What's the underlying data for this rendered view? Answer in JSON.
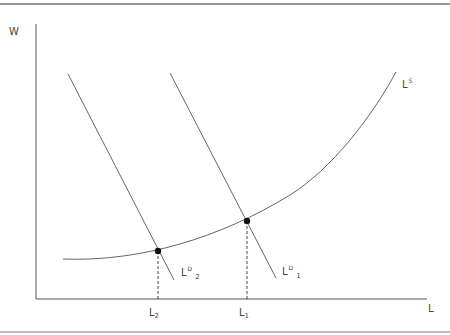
{
  "diagram": {
    "type": "labor-market-supply-demand",
    "axes": {
      "y_label": "W",
      "x_label": "L"
    },
    "curves": [
      {
        "id": "supply",
        "label": "L",
        "superscript": "S",
        "subscript": ""
      },
      {
        "id": "demand1",
        "label": "L",
        "superscript": "D",
        "subscript": "1"
      },
      {
        "id": "demand2",
        "label": "L",
        "superscript": "D",
        "subscript": "2"
      }
    ],
    "equilibria": [
      {
        "id": "e1",
        "x_tick": "L",
        "x_tick_sub": "1"
      },
      {
        "id": "e2",
        "x_tick": "L",
        "x_tick_sub": "2"
      }
    ],
    "colors": {
      "lines": "#666666",
      "points": "#111111",
      "border": "#888888"
    }
  }
}
